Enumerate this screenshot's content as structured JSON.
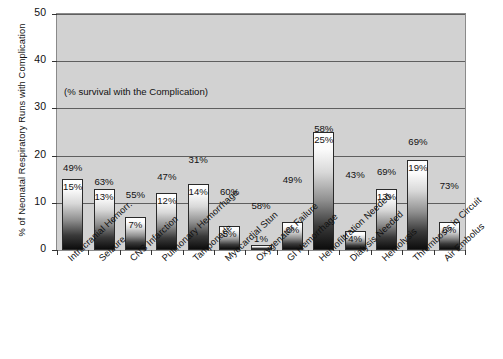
{
  "chart_data": {
    "type": "bar",
    "title": "",
    "xlabel": "",
    "ylabel": "% of Neonatal Respiratory Runs with Complication",
    "ylim": [
      0,
      50
    ],
    "yticks": [
      0,
      10,
      20,
      30,
      40,
      50
    ],
    "grid": true,
    "legend": "none",
    "annotation": "(% survival with the Complication)",
    "categories": [
      "Intracranial Hemorr.",
      "Seizure",
      "CNS Infarction",
      "Pulmonary Hemorrhage",
      "Tamponade",
      "Myocardial Stun",
      "Oxygenator Failure",
      "GI Hemorrhage",
      "Hemofiltration Needed",
      "Dialysis Needed",
      "Hemolysis",
      "Thrombosis in Circuit",
      "Air Embolus"
    ],
    "series": [
      {
        "name": "% of Neonatal Respiratory Runs with Complication",
        "values": [
          15,
          13,
          7,
          12,
          14,
          5,
          1,
          6,
          25,
          4,
          13,
          19,
          6
        ],
        "value_labels": [
          "15%",
          "13%",
          "7%",
          "12%",
          "14%",
          "5%",
          "1%",
          "6%",
          "25%",
          "4%",
          "13%",
          "19%",
          "6%"
        ]
      },
      {
        "name": "% survival with the Complication",
        "values": [
          49,
          63,
          55,
          47,
          31,
          60,
          58,
          49,
          58,
          43,
          69,
          69,
          73
        ],
        "value_labels": [
          "49%",
          "63%",
          "55%",
          "47%",
          "31%",
          "60%",
          "58%",
          "49%",
          "58%",
          "43%",
          "69%",
          "69%",
          "73%"
        ]
      }
    ],
    "ytick_labels": [
      "0",
      "10",
      "20",
      "30",
      "40",
      "50"
    ]
  },
  "caption": {
    "text": ""
  },
  "colors": {
    "plot_background": "#d2d2d2",
    "bar_top": "#ffffff",
    "bar_bottom": "#0d0d0d",
    "bar_border": "#2a2a2a",
    "gridline": "#5f5f5f",
    "text": "#111111"
  }
}
